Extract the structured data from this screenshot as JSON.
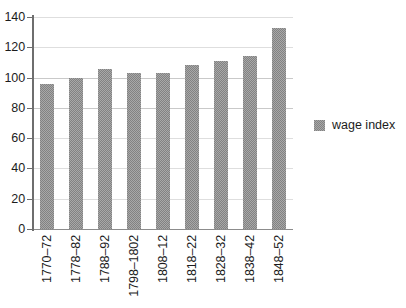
{
  "chart_data": {
    "type": "bar",
    "title": "",
    "subtitle": "",
    "xlabel": "",
    "ylabel": "",
    "categories": [
      "1770–72",
      "1778–82",
      "1788–92",
      "1798–1802",
      "1808–12",
      "1818–22",
      "1828–32",
      "1838–42",
      "1848–52"
    ],
    "series": [
      {
        "name": "wage index",
        "values": [
          96,
          100,
          106,
          103,
          103,
          108,
          111,
          114,
          133
        ],
        "color": "#828282"
      }
    ],
    "ylim": [
      0,
      140
    ],
    "ytick_step": 20,
    "yticks": [
      0,
      20,
      40,
      60,
      80,
      100,
      120,
      140
    ],
    "ytick_labels": [
      "0",
      "20",
      "40",
      "60",
      "80",
      "100",
      "120",
      "140"
    ],
    "grid": true,
    "grid_axis": "y",
    "legend_position": "right",
    "legend_entries": [
      "wage index"
    ],
    "xtick_rotation": 90,
    "annotations": []
  },
  "colors": {
    "bar_fill": "#828282",
    "gridline": "#c9c9c9",
    "axis": "#6e6e6e",
    "text": "#1c1c1c",
    "background": "#ffffff"
  }
}
